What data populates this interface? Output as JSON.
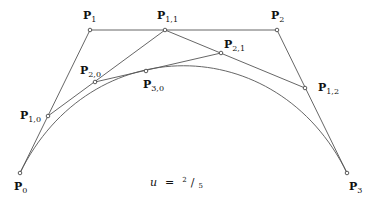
{
  "diagram": {
    "parameter": {
      "symbol": "u",
      "equals": "=",
      "numerator": "2",
      "denominator": "5",
      "value": 0.4
    },
    "control_points": [
      {
        "id": "P0",
        "base": "P",
        "sub": "0",
        "x": 20,
        "y": 173,
        "label_x": 14,
        "label_y": 190
      },
      {
        "id": "P1",
        "base": "P",
        "sub": "1",
        "x": 90,
        "y": 30,
        "label_x": 83,
        "label_y": 19
      },
      {
        "id": "P2",
        "base": "P",
        "sub": "2",
        "x": 277,
        "y": 30,
        "label_x": 271,
        "label_y": 19
      },
      {
        "id": "P3",
        "base": "P",
        "sub": "3",
        "x": 347,
        "y": 173,
        "label_x": 349,
        "label_y": 190
      }
    ],
    "level1_points": [
      {
        "id": "P1,0",
        "base": "P",
        "sub": "1,0",
        "x": 48,
        "y": 116,
        "label_x": 20,
        "label_y": 119
      },
      {
        "id": "P1,1",
        "base": "P",
        "sub": "1,1",
        "x": 165,
        "y": 30,
        "label_x": 157,
        "label_y": 19
      },
      {
        "id": "P1,2",
        "base": "P",
        "sub": "1,2",
        "x": 305,
        "y": 88,
        "label_x": 318,
        "label_y": 91
      }
    ],
    "level2_points": [
      {
        "id": "P2,0",
        "base": "P",
        "sub": "2,0",
        "x": 95,
        "y": 82,
        "label_x": 80,
        "label_y": 74
      },
      {
        "id": "P2,1",
        "base": "P",
        "sub": "2,1",
        "x": 221,
        "y": 53,
        "label_x": 224,
        "label_y": 48
      }
    ],
    "level3_points": [
      {
        "id": "P3,0",
        "base": "P",
        "sub": "3,0",
        "x": 146,
        "y": 71,
        "label_x": 143,
        "label_y": 88
      }
    ],
    "caption": {
      "x": 150,
      "y": 186
    }
  }
}
